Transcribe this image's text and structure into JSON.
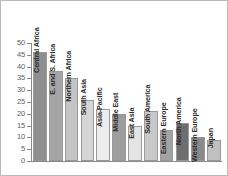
{
  "chart_data": {
    "type": "bar",
    "title": "",
    "subtitle": "",
    "xlabel": "",
    "ylabel": "",
    "ylim": [
      0,
      50
    ],
    "ytick_step": 5,
    "yticks": [
      "0",
      "5",
      "10",
      "15",
      "20",
      "25",
      "30",
      "35",
      "40",
      "45",
      "50"
    ],
    "grid": false,
    "legend": "none",
    "orientation": "vertical",
    "label_rotation": -90,
    "categories": [
      "Central Africa",
      "E. and S. Africa",
      "Northern Africa",
      "South Asia",
      "Asia-Pacific",
      "Middle East",
      "East Asia",
      "South America",
      "Eastern Europe",
      "North America",
      "Western Europe",
      "Japan"
    ],
    "values": [
      46,
      38,
      35,
      26,
      22,
      20,
      15,
      21,
      13,
      16,
      10,
      9
    ],
    "bar_colors": [
      "#8f8f8f",
      "#a6a6a6",
      "#c4c4c4",
      "#d5d5d5",
      "#ededed",
      "#9e9e9e",
      "#e4e4e4",
      "#c9c9c9",
      "#a3a3a3",
      "#6e6e6e",
      "#8a8a8a",
      "#c0c0c0"
    ],
    "axis_color": "#8a8a8a",
    "bar_border_color": "#9a9a9a",
    "tick_label_color": "#5d5d5d",
    "category_label_color": "#2b2b2b",
    "background": "#ffffff",
    "frame_color": "#b9b9b9"
  }
}
